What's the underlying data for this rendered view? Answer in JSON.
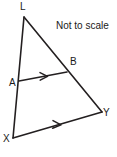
{
  "figure": {
    "title_note": "Not to scale",
    "background_color": "#ffffff",
    "stroke_color": "#231f20",
    "label_color": "#1a1a1a",
    "width": 117,
    "height": 157
  },
  "labels": {
    "L": "L",
    "A": "A",
    "X": "X",
    "B": "B",
    "Y": "Y"
  },
  "diagram_data": {
    "type": "geometry",
    "description": "Triangle LXY with a segment AB parallel to XY, where A lies on LX and B lies on LY. Single arrowheads on AB and XY indicate the two segments are parallel.",
    "points": [
      {
        "name": "L",
        "x": 24,
        "y": 17,
        "label_position": "above"
      },
      {
        "name": "A",
        "x": 19,
        "y": 81,
        "label_position": "left"
      },
      {
        "name": "X",
        "x": 13,
        "y": 138,
        "label_position": "left"
      },
      {
        "name": "B",
        "x": 67,
        "y": 72,
        "label_position": "above-right"
      },
      {
        "name": "Y",
        "x": 102,
        "y": 112,
        "label_position": "right"
      }
    ],
    "segments": [
      {
        "name": "LX",
        "from": "L",
        "to": "X",
        "marks": 0
      },
      {
        "name": "LY",
        "from": "L",
        "to": "Y",
        "marks": 0
      },
      {
        "name": "XY",
        "from": "X",
        "to": "Y",
        "marks": 1
      },
      {
        "name": "AB",
        "from": "A",
        "to": "B",
        "marks": 1
      }
    ],
    "parallel_pairs": [
      [
        "AB",
        "XY"
      ]
    ],
    "annotations": [
      "Not to scale"
    ]
  }
}
